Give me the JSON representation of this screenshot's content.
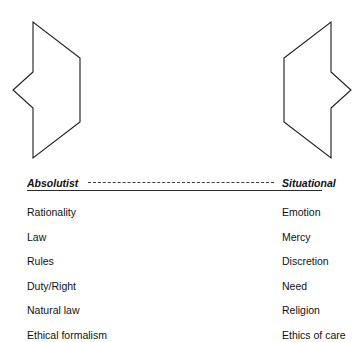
{
  "diagram": {
    "left_column": {
      "heading": "Absolutist",
      "items": [
        "Rationality",
        "Law",
        "Rules",
        "Duty/Right",
        "Natural law",
        "Ethical formalism"
      ]
    },
    "right_column": {
      "heading": "Situational",
      "items": [
        "Emotion",
        "Mercy",
        "Discretion",
        "Need",
        "Religion",
        "Ethics of care"
      ]
    },
    "arrows": {
      "left_arrow_name": "left-pointing-arrow",
      "right_arrow_name": "right-pointing-arrow",
      "stroke_color": "#1a1a1a"
    },
    "divider": {
      "style": "dashed",
      "color": "#3a3a3a"
    }
  }
}
